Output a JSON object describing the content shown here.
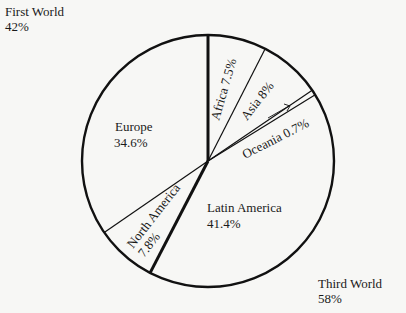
{
  "chart_data": {
    "type": "pie",
    "title": "",
    "groups": [
      {
        "name": "First World",
        "value": 42,
        "label": "42%"
      },
      {
        "name": "Third World",
        "value": 58,
        "label": "58%"
      }
    ],
    "categories": [
      "Africa",
      "Asia",
      "Oceania",
      "Latin America",
      "North America",
      "Europe"
    ],
    "values": [
      7.5,
      8,
      0.7,
      41.4,
      7.8,
      34.6
    ],
    "labels": [
      "Africa 7.5%",
      "Asia 8%",
      "Oceania 0.7%",
      "Latin America 41.4%",
      "North America 7.8%",
      "Europe 34.6%"
    ],
    "start_angle": "12 o'clock, clockwise",
    "legend": "none (direct labels)"
  },
  "annotations": {
    "first_world": {
      "name": "First World",
      "pct": "42%"
    },
    "third_world": {
      "name": "Third World",
      "pct": "58%"
    },
    "europe": {
      "name": "Europe",
      "pct": "34.6%"
    },
    "latin_america": {
      "name": "Latin America",
      "pct": "41.4%"
    },
    "north_america": {
      "name": "North America",
      "pct": "7.8%"
    },
    "africa": "Africa 7.5%",
    "asia": "Asia 8%",
    "oceania": "Oceania 0.7%"
  }
}
